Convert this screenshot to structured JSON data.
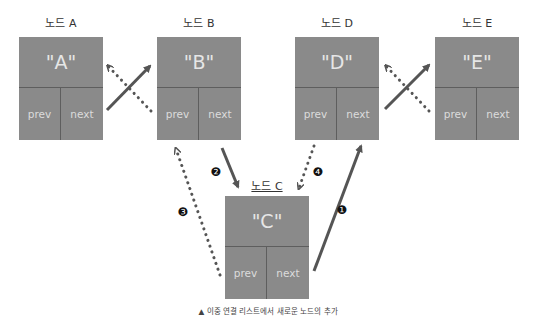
{
  "nodes": {
    "A": {
      "label": "노드 A",
      "value": "\"A\"",
      "prev": "prev",
      "next": "next"
    },
    "B": {
      "label": "노드 B",
      "value": "\"B\"",
      "prev": "prev",
      "next": "next"
    },
    "C": {
      "label": "노드 C",
      "value": "\"C\"",
      "prev": "prev",
      "next": "next"
    },
    "D": {
      "label": "노드 D",
      "value": "\"D\"",
      "prev": "prev",
      "next": "next"
    },
    "E": {
      "label": "노드 E",
      "value": "\"E\"",
      "prev": "prev",
      "next": "next"
    }
  },
  "steps": {
    "s1": "❶",
    "s2": "❷",
    "s3": "❸",
    "s4": "❹"
  },
  "caption": "▲ 이중 연결 리스트에서 새로운 노드의 추가",
  "colors": {
    "node_fill": "#8a8a8a",
    "arrow": "#555555",
    "text_in_node": "#e6e6e6"
  }
}
